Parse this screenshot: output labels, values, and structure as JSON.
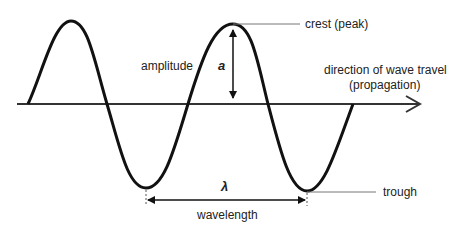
{
  "labels": {
    "crest": "crest (peak)",
    "amplitude": "amplitude",
    "amplitude_symbol": "a",
    "direction_line1": "direction of wave travel",
    "direction_line2": "(propagation)",
    "wavelength_symbol": "λ",
    "wavelength": "wavelength",
    "trough": "trough"
  },
  "colors": {
    "wave": "#111111",
    "axis": "#333333",
    "leader": "#777777"
  }
}
